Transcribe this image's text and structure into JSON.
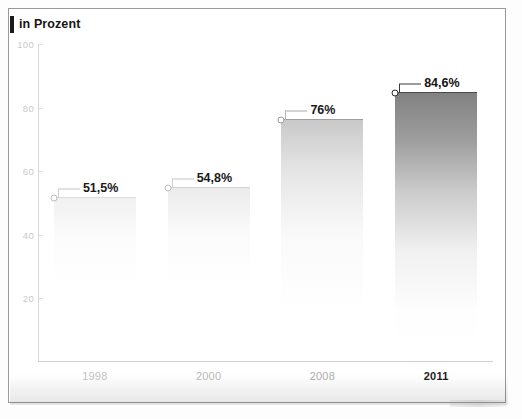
{
  "chart_data": {
    "type": "bar",
    "title": "in Prozent",
    "xlabel": "",
    "ylabel": "",
    "categories": [
      "1998",
      "2000",
      "2008",
      "2011"
    ],
    "values": [
      51.5,
      54.8,
      76,
      84.6
    ],
    "value_labels": [
      "51,5%",
      "54,8%",
      "76%",
      "84,6%"
    ],
    "ylim": [
      0,
      100
    ],
    "yticks": [
      100,
      80,
      60,
      40,
      20
    ],
    "ytick_labels": [
      "100",
      "80",
      "60",
      "40",
      "20"
    ],
    "grid": false,
    "legend": null,
    "marker": "open-circle"
  },
  "series_style": [
    {
      "category": "1998",
      "label_color": "#1a1a1a",
      "tick_color": "#c2c2c2",
      "bar_top": "rgba(205,205,205,0.55)",
      "bar_fill": "linear-gradient(180deg, rgba(226,226,226,0.50) 0%, rgba(240,240,240,0.20) 26%, rgba(255,255,255,0) 55%)"
    },
    {
      "category": "2000",
      "label_color": "#1a1a1a",
      "tick_color": "#b8b8b8",
      "bar_top": "rgba(196,196,196,0.60)",
      "bar_fill": "linear-gradient(180deg, rgba(219,219,219,0.55) 0%, rgba(238,238,238,0.24) 28%, rgba(255,255,255,0) 58%)"
    },
    {
      "category": "2008",
      "label_color": "#1a1a1a",
      "tick_color": "#adadad",
      "bar_top": "rgba(150,150,150,0.85)",
      "bar_fill": "linear-gradient(180deg, rgba(196,196,196,0.92) 0%, rgba(214,214,214,0.62) 22%, rgba(234,234,234,0.26) 48%, rgba(255,255,255,0) 78%)"
    },
    {
      "category": "2011",
      "label_color": "#141414",
      "tick_color": "#1c1c1c",
      "bar_top": "rgba(70,70,70,0.95)",
      "bar_fill": "linear-gradient(180deg, rgba(126,126,126,0.98) 0%, rgba(150,150,150,0.92) 18%, rgba(184,184,184,0.70) 38%, rgba(219,219,219,0.38) 60%, rgba(244,244,244,0.12) 82%, rgba(255,255,255,0) 96%)"
    }
  ],
  "colors": {
    "frame": "#9a9a9a",
    "axis": "#d8d8d8",
    "title_accent": "#1a1a1a",
    "label_dark": "#1a1a1a",
    "tick_faded": "#c9c9c9"
  }
}
